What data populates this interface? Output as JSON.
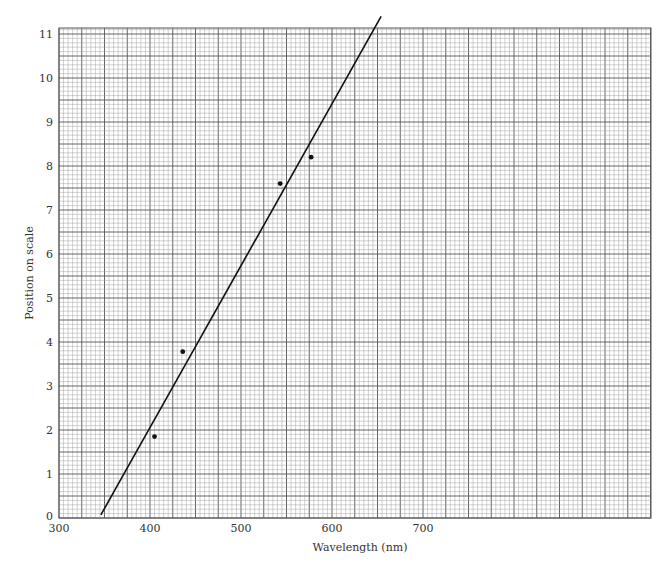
{
  "chart_data": {
    "type": "scatter",
    "title": "",
    "xlabel": "Wavelength (nm)",
    "ylabel": "Position on scale",
    "x_ticks": [
      300,
      400,
      500,
      600,
      700
    ],
    "y_ticks": [
      0,
      1,
      2,
      3,
      4,
      5,
      6,
      7,
      8,
      9,
      10,
      11
    ],
    "xlim": [
      300,
      950
    ],
    "ylim": [
      0,
      11
    ],
    "grid": true,
    "grid_style": "graph paper (major and minor lines)",
    "series": [
      {
        "name": "measurements",
        "type": "scatter",
        "points": [
          {
            "x": 405,
            "y": 1.85
          },
          {
            "x": 436,
            "y": 3.78
          },
          {
            "x": 543,
            "y": 7.6
          },
          {
            "x": 577,
            "y": 8.2
          }
        ]
      },
      {
        "name": "best-fit line",
        "type": "line",
        "points": [
          {
            "x": 346,
            "y": 0.07
          },
          {
            "x": 654,
            "y": 11.4
          }
        ]
      }
    ],
    "legend": null
  },
  "layout": {
    "plot": {
      "left": 59,
      "top": 28,
      "right": 651,
      "bottom": 518
    },
    "x_px_per_unit": 0.91,
    "y_px_per_unit": 44,
    "colors": {
      "major_grid": "#555555",
      "minor_grid": "#9a9a9a",
      "line": "#111111",
      "points": "#111111"
    }
  }
}
